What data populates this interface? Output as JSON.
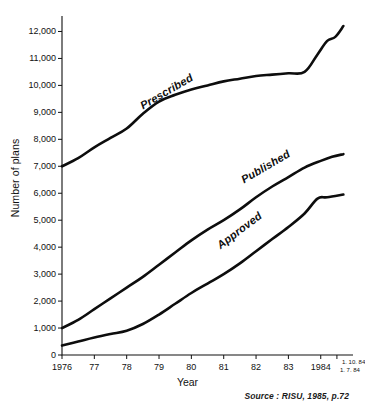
{
  "chart_data": {
    "type": "line",
    "title": "",
    "xlabel": "Year",
    "ylabel": "Number of plans",
    "ylim": [
      0,
      12500
    ],
    "xlim": [
      1976,
      1984.75
    ],
    "grid": false,
    "legend_position": "inline-on-curve",
    "yticks": [
      0,
      1000,
      2000,
      3000,
      4000,
      5000,
      6000,
      7000,
      8000,
      9000,
      10000,
      11000,
      12000
    ],
    "ytick_labels": [
      "0",
      "1,000",
      "2,000",
      "3,000",
      "4,000",
      "5,000",
      "6,000",
      "7,000",
      "8,000",
      "9,000",
      "10,000",
      "11,000",
      "12,000"
    ],
    "xticks": [
      1976,
      1977,
      1978,
      1979,
      1980,
      1981,
      1982,
      1983,
      1984,
      1984.5
    ],
    "xtick_labels": [
      "1976",
      "77",
      "78",
      "79",
      "80",
      "81",
      "82",
      "83",
      "1984",
      ""
    ],
    "xtick_extra_labels": [
      "1. 10. 84",
      "1. 7. 84"
    ],
    "series": [
      {
        "name": "Prescribed",
        "label": "Prescribed",
        "x": [
          1976,
          1976.5,
          1977,
          1977.5,
          1978,
          1978.5,
          1979,
          1979.5,
          1980,
          1980.5,
          1981,
          1981.5,
          1982,
          1982.5,
          1983,
          1983.5,
          1983.9,
          1984.2,
          1984.45,
          1984.7
        ],
        "values": [
          7000,
          7300,
          7700,
          8050,
          8400,
          8950,
          9400,
          9650,
          9850,
          10000,
          10150,
          10250,
          10350,
          10400,
          10450,
          10500,
          11150,
          11650,
          11800,
          12200
        ]
      },
      {
        "name": "Published",
        "label": "Published",
        "x": [
          1976,
          1976.5,
          1977,
          1977.5,
          1978,
          1978.5,
          1979,
          1979.5,
          1980,
          1980.5,
          1981,
          1981.5,
          1982,
          1982.5,
          1983,
          1983.5,
          1984,
          1984.35,
          1984.7
        ],
        "values": [
          1000,
          1300,
          1700,
          2100,
          2500,
          2900,
          3350,
          3800,
          4250,
          4650,
          5000,
          5400,
          5850,
          6250,
          6600,
          6950,
          7200,
          7350,
          7450
        ]
      },
      {
        "name": "Approved",
        "label": "Approved",
        "x": [
          1976,
          1976.5,
          1977,
          1977.5,
          1978,
          1978.5,
          1979,
          1979.5,
          1980,
          1980.5,
          1981,
          1981.5,
          1982,
          1982.5,
          1983,
          1983.5,
          1983.9,
          1984.2,
          1984.7
        ],
        "values": [
          350,
          500,
          650,
          780,
          900,
          1150,
          1500,
          1900,
          2300,
          2650,
          3000,
          3400,
          3850,
          4300,
          4750,
          5250,
          5800,
          5850,
          5950
        ]
      }
    ],
    "source_note": "Source : RISU, 1985, p.72"
  }
}
